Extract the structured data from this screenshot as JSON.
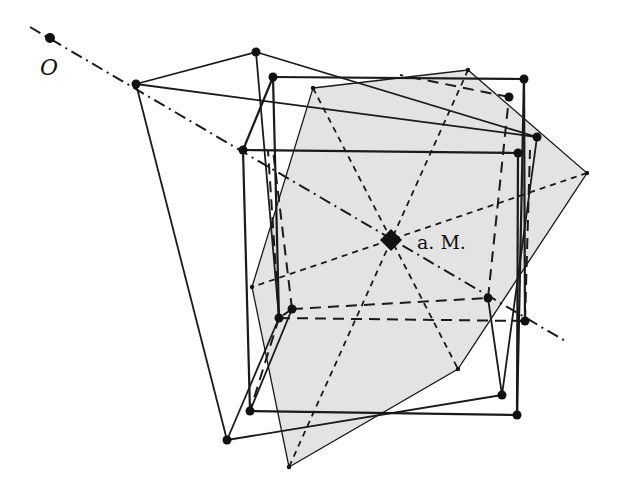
{
  "diagram": {
    "title": "",
    "labels": {
      "origin": "O",
      "center": "a. M."
    },
    "colors": {
      "stroke": "#1a1a1a",
      "fill_plane": "#e3e3e3",
      "background": "#ffffff"
    },
    "points": {
      "O": [
        50,
        38
      ],
      "M": [
        391,
        240
      ]
    },
    "axis_line": {
      "from": [
        30,
        27
      ],
      "to": [
        567,
        342
      ],
      "style": "dash-dot"
    },
    "gray_hexagon": [
      [
        313,
        88
      ],
      [
        468,
        70
      ],
      [
        587,
        173
      ],
      [
        458,
        369
      ],
      [
        289,
        467
      ],
      [
        252,
        287
      ]
    ],
    "hexagon_diagonals": [
      [
        [
          313,
          88
        ],
        [
          458,
          369
        ]
      ],
      [
        [
          468,
          70
        ],
        [
          289,
          467
        ]
      ],
      [
        [
          587,
          173
        ],
        [
          252,
          287
        ]
      ]
    ],
    "front_cube": {
      "top": [
        [
          273,
          77
        ],
        [
          524,
          79
        ],
        [
          518,
          153
        ],
        [
          243,
          150
        ]
      ],
      "bottom": [
        [
          279,
          318
        ],
        [
          525,
          321
        ],
        [
          517,
          415
        ],
        [
          250,
          411
        ]
      ]
    },
    "image_solid": {
      "vertices": [
        [
          136,
          84
        ],
        [
          256,
          52
        ],
        [
          537,
          137
        ],
        [
          502,
          395
        ],
        [
          227,
          440
        ]
      ]
    },
    "dashed_square": [
      [
        292,
        309
      ],
      [
        488,
        298
      ],
      [
        509,
        97
      ],
      [
        313,
        88
      ]
    ]
  }
}
